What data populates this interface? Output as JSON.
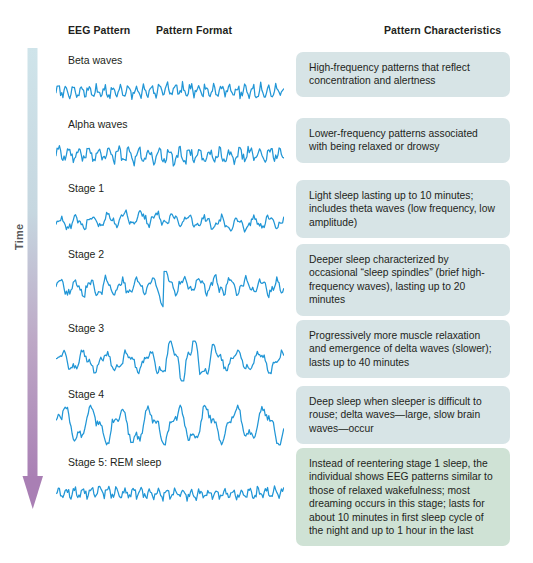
{
  "headers": {
    "eeg_pattern": "EEG Pattern",
    "pattern_format": "Pattern Format",
    "pattern_characteristics": "Pattern Characteristics"
  },
  "axis": {
    "time_label": "Time",
    "gradient_top_color": "#cfe4ea",
    "gradient_bottom_color": "#a97fb4",
    "arrowhead_color": "#a97fb4"
  },
  "colors": {
    "wave": "#2196d6",
    "box_blue": "#d7e4e6",
    "box_green": "#cfe2d5",
    "text": "#231f20"
  },
  "rows": [
    {
      "label": "Beta waves",
      "description": "High-frequency patterns that reflect concentration and alertness",
      "box_variant": "blue",
      "wave": {
        "amplitude": 5,
        "frequency": 1.55,
        "noise": 2.6,
        "spike_at": null,
        "spike_amp": 0,
        "burst_start": null,
        "burst_end": null,
        "burst_gain": 1,
        "drift": 0.7,
        "seed": 11
      }
    },
    {
      "label": "Alpha waves",
      "description": "Lower-frequency patterns associated with being relaxed or drowsy",
      "box_variant": "blue",
      "wave": {
        "amplitude": 6,
        "frequency": 1.2,
        "noise": 2.9,
        "spike_at": null,
        "spike_amp": 0,
        "burst_start": null,
        "burst_end": null,
        "burst_gain": 1,
        "drift": 1.1,
        "seed": 23
      }
    },
    {
      "label": "Stage 1",
      "description": "Light sleep lasting up to 10 minutes; includes theta waves (low frequency, low amplitude)",
      "box_variant": "blue",
      "wave": {
        "amplitude": 5,
        "frequency": 0.75,
        "noise": 2.2,
        "spike_at": null,
        "spike_amp": 0,
        "burst_start": null,
        "burst_end": null,
        "burst_gain": 1,
        "drift": 2.6,
        "seed": 37
      }
    },
    {
      "label": "Stage 2",
      "description": "Deeper sleep characterized by occasional “sleep spindles” (brief high-frequency waves), lasting up to 20 minutes",
      "box_variant": "blue",
      "wave": {
        "amplitude": 7,
        "frequency": 0.78,
        "noise": 2.6,
        "spike_at": 0.47,
        "spike_amp": 19,
        "burst_start": null,
        "burst_end": null,
        "burst_gain": 1,
        "drift": 1.4,
        "seed": 53
      }
    },
    {
      "label": "Stage 3",
      "description": "Progressively more muscle relaxation and emergence of delta waves (slower); lasts up to 40 minutes",
      "box_variant": "blue",
      "wave": {
        "amplitude": 8,
        "frequency": 0.55,
        "noise": 2.4,
        "spike_at": null,
        "spike_amp": 0,
        "burst_start": 0.42,
        "burst_end": 0.72,
        "burst_gain": 2.5,
        "drift": 1.2,
        "seed": 71
      }
    },
    {
      "label": "Stage 4",
      "description": "Deep sleep when sleeper is difficult to rouse; delta waves—large, slow brain waves—occur",
      "box_variant": "blue",
      "wave": {
        "amplitude": 15,
        "frequency": 0.42,
        "noise": 3.2,
        "spike_at": null,
        "spike_amp": 0,
        "burst_start": null,
        "burst_end": null,
        "burst_gain": 1,
        "drift": 1.0,
        "seed": 89
      }
    },
    {
      "label": "Stage 5: REM sleep",
      "description": "Instead of reentering stage 1 sleep, the individual shows EEG patterns similar to those of relaxed wakefulness; most dreaming occurs in this stage; lasts for about 10 minutes in first sleep cycle of the night and up to 1 hour in the last",
      "box_variant": "green",
      "wave": {
        "amplitude": 4,
        "frequency": 1.45,
        "noise": 2.4,
        "spike_at": null,
        "spike_amp": 0,
        "burst_start": null,
        "burst_end": null,
        "burst_gain": 1,
        "drift": 0.8,
        "seed": 103
      }
    }
  ],
  "layout": {
    "row_tops": [
      48,
      112,
      176,
      242,
      316,
      382,
      450
    ],
    "label_offsets": [
      6,
      6,
      6,
      6,
      6,
      6,
      6
    ],
    "wave_offsets": [
      22,
      22,
      24,
      24,
      24,
      22,
      22
    ],
    "box_tops": [
      52,
      118,
      180,
      244,
      320,
      386,
      448
    ],
    "wave_width": 228,
    "wave_height": 42
  }
}
